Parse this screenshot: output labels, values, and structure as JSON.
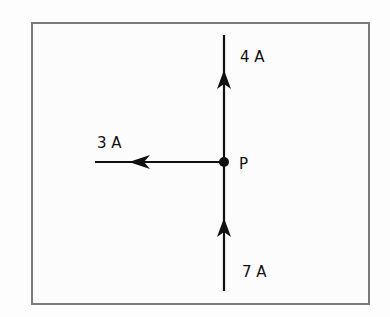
{
  "diagram": {
    "type": "current-junction",
    "junction": {
      "label": "P",
      "x": 224,
      "y": 162
    },
    "branches": [
      {
        "id": "top",
        "label": "4 A",
        "direction": "out",
        "arrow": "up"
      },
      {
        "id": "left",
        "label": "3 A",
        "direction": "out",
        "arrow": "left"
      },
      {
        "id": "bottom",
        "label": "7 A",
        "direction": "in",
        "arrow": "up"
      }
    ],
    "colors": {
      "line": "#111111",
      "frame": "#7a7a7a",
      "background": "#fcfcfc"
    }
  }
}
